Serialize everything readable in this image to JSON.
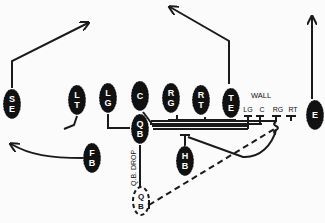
{
  "diagram": {
    "colors": {
      "player_fill": "#111111",
      "line": "#1a1a1a",
      "background": "#fbfbfb",
      "label": "#ffffff"
    },
    "players": [
      {
        "id": "SE",
        "label": "SE",
        "x": 12,
        "y": 104,
        "letters": [
          "S",
          "E"
        ]
      },
      {
        "id": "LT",
        "label": "LT",
        "x": 77,
        "y": 100,
        "letters": [
          "L",
          "T"
        ]
      },
      {
        "id": "LG",
        "label": "LG",
        "x": 108,
        "y": 98,
        "letters": [
          "L",
          "G"
        ]
      },
      {
        "id": "C",
        "label": "C",
        "x": 140,
        "y": 96,
        "letters": [
          "C"
        ]
      },
      {
        "id": "RG",
        "label": "RG",
        "x": 171,
        "y": 98,
        "letters": [
          "R",
          "G"
        ]
      },
      {
        "id": "RT",
        "label": "RT",
        "x": 201,
        "y": 100,
        "letters": [
          "R",
          "T"
        ]
      },
      {
        "id": "TE",
        "label": "TE",
        "x": 231,
        "y": 103,
        "letters": [
          "T",
          "E"
        ]
      },
      {
        "id": "E",
        "label": "E",
        "x": 315,
        "y": 115,
        "letters": [
          "E"
        ]
      },
      {
        "id": "QB",
        "label": "QB",
        "x": 140,
        "y": 129,
        "letters": [
          "Q",
          "B"
        ]
      },
      {
        "id": "FB",
        "label": "FB",
        "x": 92,
        "y": 158,
        "letters": [
          "F",
          "B"
        ]
      },
      {
        "id": "HB",
        "label": "HB",
        "x": 185,
        "y": 161,
        "letters": [
          "H",
          "B"
        ]
      }
    ],
    "qb_drop": {
      "label": "Q.B. DROP",
      "ghost_label": "QB",
      "letters": [
        "Q",
        "B"
      ],
      "x": 141,
      "y": 201
    },
    "wall": {
      "title": "WALL",
      "labels": [
        "LG",
        "C",
        "RG",
        "RT"
      ]
    },
    "routes": [
      {
        "player": "SE",
        "description": "stem up then post to right"
      },
      {
        "player": "TE",
        "description": "stem up then angle left"
      },
      {
        "player": "E",
        "description": "straight vertical"
      },
      {
        "player": "FB",
        "description": "swing to left flat"
      },
      {
        "player": "HB",
        "description": "release right, loop back"
      },
      {
        "player": "QB",
        "description": "drop back, dashed pass path right"
      }
    ]
  }
}
